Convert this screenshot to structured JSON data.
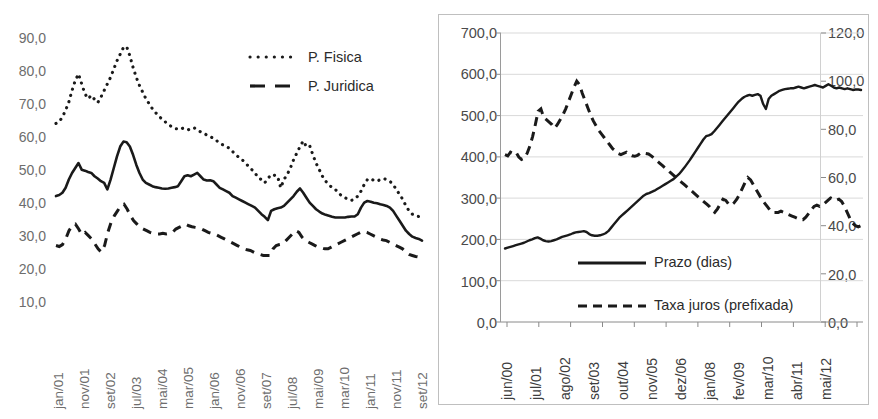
{
  "figure": {
    "background": "#ffffff",
    "panels": [
      "left-panel",
      "right-panel"
    ]
  },
  "chart_data": [
    {
      "id": "credit-spread-chart",
      "type": "line",
      "title": "",
      "subtitle": "",
      "xlabel": "",
      "ylabel": "",
      "ylim": [
        10.0,
        90.0
      ],
      "ytick_step": 10.0,
      "grid": false,
      "frame": false,
      "legend_position": "top-right",
      "ytick_labels": [
        "90,0",
        "80,0",
        "70,0",
        "60,0",
        "50,0",
        "40,0",
        "30,0",
        "20,0",
        "10,0"
      ],
      "ytick_values": [
        90.0,
        80.0,
        70.0,
        60.0,
        50.0,
        40.0,
        30.0,
        20.0,
        10.0
      ],
      "xtick_labels": [
        "jan/01",
        "nov/01",
        "set/02",
        "jul/03",
        "mai/04",
        "mar/05",
        "jan/06",
        "nov/06",
        "set/07",
        "jul/08",
        "mai/09",
        "mar/10",
        "jan/11",
        "nov/11",
        "set/12"
      ],
      "legend": [
        {
          "name": "P. Fisica",
          "style": "dotted"
        },
        {
          "name": "P. Juridica",
          "style": "dashed"
        }
      ],
      "series": [
        {
          "name": "P. Fisica",
          "style": "dotted",
          "color": "#1a1a1a",
          "values": [
            63.5,
            64.0,
            65.5,
            67.5,
            70.0,
            73.5,
            76.5,
            78.5,
            75.5,
            72.5,
            71.0,
            72.0,
            70.8,
            69.8,
            71.5,
            73.5,
            75.5,
            77.5,
            80.0,
            82.5,
            84.5,
            86.5,
            86.8,
            84.0,
            80.5,
            77.5,
            75.0,
            73.0,
            71.0,
            69.5,
            68.0,
            66.8,
            65.8,
            64.8,
            64.0,
            63.2,
            62.5,
            62.0,
            61.8,
            62.2,
            61.8,
            61.5,
            62.0,
            62.2,
            61.5,
            61.0,
            60.5,
            60.0,
            59.5,
            59.0,
            58.3,
            57.5,
            57.0,
            56.5,
            56.0,
            55.0,
            54.0,
            53.2,
            52.5,
            51.5,
            50.5,
            49.5,
            48.5,
            47.0,
            46.5,
            45.5,
            46.8,
            48.0,
            47.8,
            47.5,
            44.0,
            46.5,
            48.0,
            50.0,
            52.5,
            54.5,
            56.5,
            58.2,
            56.5,
            56.8,
            54.0,
            51.5,
            49.5,
            47.5,
            46.0,
            45.0,
            44.0,
            43.5,
            42.5,
            41.5,
            41.0,
            40.5,
            40.2,
            40.5,
            41.5,
            43.0,
            45.0,
            46.5,
            46.8,
            46.2,
            46.0,
            46.5,
            46.8,
            46.5,
            46.0,
            45.0,
            43.5,
            42.0,
            40.5,
            38.5,
            37.0,
            36.0,
            35.5,
            35.3,
            35.2
          ]
        },
        {
          "name": "Total",
          "style": "solid",
          "color": "#1a1a1a",
          "values": [
            41.5,
            41.8,
            42.5,
            44.0,
            46.5,
            48.5,
            50.0,
            51.5,
            49.5,
            49.2,
            48.8,
            48.5,
            47.5,
            46.8,
            46.0,
            45.5,
            43.5,
            46.5,
            50.0,
            53.5,
            56.5,
            58.0,
            57.8,
            56.5,
            54.0,
            51.0,
            48.5,
            46.5,
            45.5,
            45.0,
            44.5,
            44.2,
            44.0,
            43.8,
            43.7,
            43.8,
            44.0,
            44.2,
            44.5,
            46.0,
            47.5,
            47.8,
            47.5,
            48.0,
            48.5,
            47.5,
            46.5,
            46.2,
            46.3,
            46.0,
            45.0,
            44.0,
            43.5,
            43.0,
            42.5,
            41.5,
            41.0,
            40.5,
            40.0,
            39.5,
            39.0,
            38.5,
            38.0,
            37.0,
            36.0,
            35.2,
            34.2,
            37.0,
            37.5,
            37.8,
            38.0,
            38.5,
            39.5,
            40.5,
            41.5,
            42.8,
            43.8,
            42.5,
            41.0,
            39.5,
            38.5,
            37.5,
            36.8,
            36.2,
            35.8,
            35.5,
            35.2,
            35.0,
            35.0,
            35.0,
            35.0,
            35.2,
            35.3,
            35.3,
            36.0,
            38.0,
            39.5,
            40.0,
            39.8,
            39.5,
            39.3,
            39.0,
            38.8,
            38.5,
            38.0,
            37.0,
            35.5,
            34.0,
            32.5,
            31.0,
            30.0,
            29.2,
            28.8,
            28.5,
            28.0
          ]
        },
        {
          "name": "P. Juridica",
          "style": "dashed",
          "color": "#1a1a1a",
          "values": [
            26.5,
            26.2,
            26.8,
            28.5,
            31.0,
            32.5,
            33.0,
            31.5,
            29.8,
            30.5,
            29.5,
            28.5,
            27.0,
            25.5,
            24.5,
            26.5,
            30.5,
            33.5,
            35.5,
            37.0,
            38.5,
            39.0,
            37.5,
            35.5,
            34.0,
            33.0,
            32.0,
            31.5,
            31.0,
            30.5,
            30.2,
            30.0,
            30.0,
            30.2,
            30.0,
            30.2,
            30.5,
            31.5,
            32.0,
            32.5,
            33.0,
            32.5,
            32.2,
            32.0,
            31.8,
            31.5,
            31.0,
            30.5,
            30.2,
            30.0,
            29.5,
            29.0,
            28.5,
            28.0,
            27.5,
            27.0,
            26.5,
            26.0,
            25.5,
            25.2,
            25.0,
            24.5,
            24.0,
            23.8,
            23.5,
            23.5,
            23.5,
            25.5,
            26.5,
            26.8,
            27.0,
            28.0,
            29.0,
            30.0,
            31.0,
            30.5,
            29.0,
            28.0,
            27.5,
            27.0,
            26.5,
            26.0,
            25.8,
            25.5,
            25.5,
            26.0,
            26.5,
            27.0,
            27.5,
            28.0,
            28.5,
            29.0,
            29.5,
            30.0,
            30.5,
            30.8,
            30.5,
            30.0,
            29.5,
            29.0,
            28.5,
            28.2,
            28.0,
            27.5,
            27.0,
            26.5,
            26.0,
            25.5,
            24.5,
            23.8,
            23.5,
            23.2,
            23.0,
            23.0
          ]
        }
      ]
    },
    {
      "id": "prazo-taxa-chart",
      "type": "line",
      "title": "",
      "subtitle": "",
      "xlabel": "",
      "ylabel": "",
      "ylim": [
        0.0,
        700.0
      ],
      "ytick_step": 100.0,
      "y2lim": [
        0.0,
        120.0
      ],
      "y2tick_step": 20.0,
      "grid": true,
      "frame": true,
      "legend_position": "inside-bottom-center",
      "ytick_labels": [
        "700,0",
        "600,0",
        "500,0",
        "400,0",
        "300,0",
        "200,0",
        "100,0",
        "0,0"
      ],
      "ytick_values": [
        700.0,
        600.0,
        500.0,
        400.0,
        300.0,
        200.0,
        100.0,
        0.0
      ],
      "y2tick_labels": [
        "120,0",
        "100,0",
        "80,0",
        "60,0",
        "40,0",
        "20,0",
        "0,0"
      ],
      "y2tick_values": [
        120.0,
        100.0,
        80.0,
        60.0,
        40.0,
        20.0,
        0.0
      ],
      "xtick_labels": [
        "jun/00",
        "jul/01",
        "ago/02",
        "set/03",
        "out/04",
        "nov/05",
        "dez/06",
        "jan/08",
        "fev/09",
        "mar/10",
        "abr/11",
        "mai/12"
      ],
      "legend": [
        {
          "name": "Prazo (dias)",
          "style": "solid"
        },
        {
          "name": "Taxa juros (prefixada)",
          "style": "dashed"
        }
      ],
      "series": [
        {
          "name": "Prazo (dias)",
          "style": "solid",
          "color": "#1a1a1a",
          "axis": "left",
          "values": [
            178,
            180,
            182,
            184,
            186,
            188,
            190,
            192,
            195,
            198,
            200,
            203,
            205,
            202,
            198,
            196,
            195,
            196,
            198,
            200,
            203,
            206,
            208,
            210,
            212,
            215,
            217,
            218,
            219,
            220,
            218,
            213,
            210,
            209,
            209,
            210,
            212,
            215,
            220,
            228,
            236,
            244,
            252,
            258,
            264,
            270,
            276,
            282,
            288,
            294,
            300,
            306,
            310,
            312,
            315,
            318,
            322,
            326,
            330,
            334,
            338,
            342,
            346,
            352,
            358,
            366,
            374,
            383,
            392,
            402,
            412,
            422,
            432,
            442,
            450,
            452,
            455,
            462,
            470,
            478,
            486,
            494,
            502,
            510,
            518,
            526,
            534,
            540,
            545,
            548,
            550,
            548,
            550,
            552,
            548,
            528,
            516,
            540,
            548,
            552,
            556,
            560,
            562,
            564,
            565,
            566,
            566,
            568,
            570,
            568,
            566,
            568,
            570,
            572,
            574,
            572,
            570,
            568,
            572,
            576,
            572,
            568,
            566,
            568,
            566,
            564,
            566,
            564,
            562,
            563,
            563,
            562
          ]
        },
        {
          "name": "Taxa juros (prefixada)",
          "style": "dashed",
          "color": "#1a1a1a",
          "axis": "right",
          "values": [
            69.5,
            69.0,
            70.5,
            70.0,
            70.5,
            68.5,
            67.5,
            68.0,
            70.0,
            73.0,
            77.0,
            82.0,
            87.5,
            88.5,
            85.0,
            84.0,
            83.0,
            82.0,
            80.5,
            82.0,
            84.0,
            86.0,
            88.5,
            91.5,
            94.5,
            97.5,
            100.0,
            98.5,
            95.0,
            92.0,
            89.0,
            86.0,
            83.5,
            81.5,
            79.5,
            78.0,
            76.5,
            75.0,
            73.5,
            72.0,
            71.0,
            70.0,
            69.5,
            70.0,
            70.5,
            69.5,
            69.0,
            68.8,
            69.2,
            70.0,
            70.2,
            70.0,
            69.8,
            69.0,
            68.0,
            67.0,
            66.0,
            65.0,
            64.0,
            63.0,
            62.0,
            61.0,
            60.0,
            59.0,
            58.0,
            57.0,
            56.0,
            55.0,
            54.0,
            53.0,
            52.0,
            51.0,
            50.0,
            49.0,
            48.0,
            46.5,
            45.5,
            47.0,
            49.0,
            51.0,
            50.5,
            49.0,
            48.5,
            49.5,
            51.0,
            53.0,
            55.5,
            58.0,
            60.0,
            59.0,
            57.0,
            55.0,
            53.0,
            51.0,
            49.5,
            48.0,
            46.5,
            45.5,
            45.5,
            45.5,
            46.0,
            45.5,
            45.0,
            44.5,
            44.0,
            43.5,
            43.0,
            42.5,
            42.5,
            43.5,
            45.0,
            46.5,
            48.0,
            48.5,
            48.0,
            48.5,
            49.5,
            50.5,
            51.5,
            51.0,
            50.5,
            51.0,
            50.0,
            48.0,
            45.5,
            43.0,
            41.0,
            40.0,
            39.5,
            40.0
          ]
        }
      ]
    }
  ]
}
